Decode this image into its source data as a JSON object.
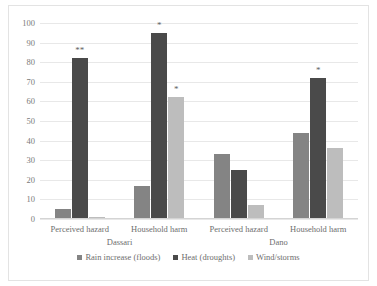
{
  "chart_data": {
    "type": "bar",
    "title": "",
    "xlabel": "",
    "ylabel": "",
    "ylim": [
      0,
      100
    ],
    "yticks": [
      100,
      90,
      80,
      70,
      60,
      50,
      40,
      30,
      20,
      10,
      0
    ],
    "grid": true,
    "legend_position": "bottom",
    "panels": [
      "Dassari",
      "Dano"
    ],
    "categories": [
      "Perceived hazard",
      "Household harm",
      "Perceived hazard",
      "Household harm"
    ],
    "series": [
      {
        "name": "Rain increase (floods)",
        "color": "#848484",
        "values": [
          5,
          17,
          33,
          44
        ]
      },
      {
        "name": "Heat (droughts)",
        "color": "#4a4a4a",
        "values": [
          82,
          95,
          25,
          72
        ]
      },
      {
        "name": "Wind/storms",
        "color": "#bdbdbd",
        "values": [
          1,
          62,
          7,
          36
        ]
      }
    ],
    "annotations": [
      {
        "group": 0,
        "series": 1,
        "label": "**"
      },
      {
        "group": 1,
        "series": 1,
        "label": "*"
      },
      {
        "group": 1,
        "series": 2,
        "label": "*"
      },
      {
        "group": 3,
        "series": 1,
        "label": "*"
      }
    ]
  },
  "legend": {
    "items": [
      {
        "label": "Rain increase (floods)",
        "color": "#848484"
      },
      {
        "label": "Heat (droughts)",
        "color": "#4a4a4a"
      },
      {
        "label": "Wind/storms",
        "color": "#bdbdbd"
      }
    ]
  },
  "axis": {
    "y_labels": [
      "100",
      "90",
      "80",
      "70",
      "60",
      "50",
      "40",
      "30",
      "20",
      "10",
      "0"
    ],
    "category_labels": [
      "Perceived hazard",
      "Household harm",
      "Perceived hazard",
      "Household harm"
    ],
    "panel_labels": [
      "Dassari",
      "Dano"
    ]
  }
}
